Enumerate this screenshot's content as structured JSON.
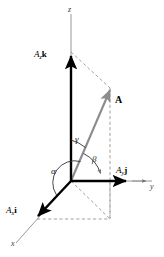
{
  "figure": {
    "background_color": "#ffffff",
    "axis_color": "#7a7a7a",
    "vector_color": "#8c8c8c",
    "component_color": "#000000",
    "dashed_color": "#8c8c8c"
  },
  "axes": {
    "x_label": "x",
    "y_label": "y",
    "z_label": "z"
  },
  "components": {
    "x": {
      "text": "A",
      "sub": "x",
      "unit": "i"
    },
    "y": {
      "text": "A",
      "sub": "y",
      "unit": "j"
    },
    "z": {
      "text": "A",
      "sub": "z",
      "unit": "k"
    }
  },
  "vector": {
    "label": "A"
  },
  "angles": {
    "alpha": "α",
    "beta": "β",
    "gamma": "γ"
  }
}
